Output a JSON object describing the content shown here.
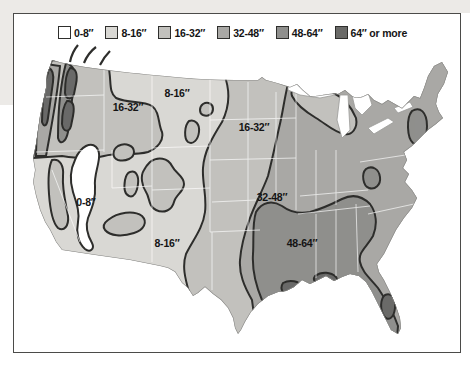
{
  "legend": {
    "items": [
      {
        "label": "0-8″",
        "zone": "c0"
      },
      {
        "label": "8-16″",
        "zone": "c1"
      },
      {
        "label": "16-32″",
        "zone": "c2"
      },
      {
        "label": "32-48″",
        "zone": "c3"
      },
      {
        "label": "48-64″",
        "zone": "c4"
      },
      {
        "label": "64″ or more",
        "zone": "c5"
      }
    ]
  },
  "map": {
    "description": "United States average annual precipitation zones",
    "labels": [
      {
        "text": "8-16″",
        "region": "montana"
      },
      {
        "text": "16-32″",
        "region": "idaho-rockies"
      },
      {
        "text": "16-32″",
        "region": "great-plains"
      },
      {
        "text": "0-8″",
        "region": "great-basin"
      },
      {
        "text": "8-16″",
        "region": "southwest"
      },
      {
        "text": "32-48″",
        "region": "midwest"
      },
      {
        "text": "48-64″",
        "region": "south"
      }
    ]
  },
  "palette": {
    "c0": "#ffffff",
    "c1": "#d9d8d4",
    "c2": "#c2c1bd",
    "c3": "#a9a8a5",
    "c4": "#8f8f8d",
    "c5": "#6a6a68",
    "contour": "#2e2e2c",
    "coast": "#8a8a88",
    "frame": "#4b4b49"
  }
}
